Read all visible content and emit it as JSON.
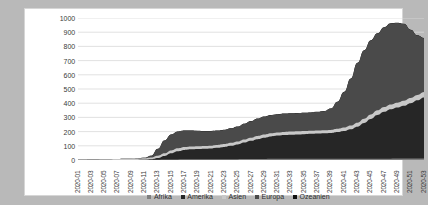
{
  "chart_data": {
    "type": "area",
    "stacked": true,
    "title": "",
    "xlabel": "",
    "ylabel": "",
    "ylim": [
      0,
      1000
    ],
    "ytick_labels": [
      "1000",
      "900",
      "800",
      "700",
      "600",
      "500",
      "400",
      "300",
      "200",
      "100",
      "0"
    ],
    "ytick_values": [
      1000,
      900,
      800,
      700,
      600,
      500,
      400,
      300,
      200,
      100,
      0
    ],
    "grid": true,
    "legend_position": "bottom",
    "x": [
      "2020-01",
      "2020-02",
      "2020-03",
      "2020-04",
      "2020-05",
      "2020-06",
      "2020-07",
      "2020-08",
      "2020-09",
      "2020-10",
      "2020-11",
      "2020-12",
      "2020-13",
      "2020-14",
      "2020-15",
      "2020-16",
      "2020-17",
      "2020-18",
      "2020-19",
      "2020-20",
      "2020-21",
      "2020-22",
      "2020-23",
      "2020-24",
      "2020-25",
      "2020-26",
      "2020-27",
      "2020-28",
      "2020-29",
      "2020-30",
      "2020-31",
      "2020-32",
      "2020-33",
      "2020-34",
      "2020-35",
      "2020-36",
      "2020-37",
      "2020-38",
      "2020-39",
      "2020-40",
      "2020-41",
      "2020-42",
      "2020-43",
      "2020-44",
      "2020-45",
      "2020-46",
      "2020-47",
      "2020-48",
      "2020-49",
      "2020-50",
      "2020-51",
      "2020-52",
      "2020-53"
    ],
    "xtick_labels": [
      "2020-01",
      "2020-03",
      "2020-05",
      "2020-07",
      "2020-09",
      "2020-11",
      "2020-13",
      "2020-15",
      "2020-17",
      "2020-19",
      "2020-21",
      "2020-23",
      "2020-25",
      "2020-27",
      "2020-29",
      "2020-31",
      "2020-33",
      "2020-35",
      "2020-37",
      "2020-39",
      "2020-41",
      "2020-43",
      "2020-45",
      "2020-47",
      "2020-49",
      "2020-51",
      "2020-53"
    ],
    "series": [
      {
        "name": "Afrika",
        "color": "#7f7f7f",
        "values": [
          0,
          0,
          0,
          0,
          0,
          0,
          0,
          0,
          0,
          0,
          0,
          1,
          2,
          3,
          4,
          4,
          5,
          5,
          5,
          5,
          5,
          6,
          6,
          6,
          6,
          7,
          7,
          7,
          7,
          8,
          8,
          8,
          8,
          8,
          8,
          8,
          8,
          8,
          8,
          9,
          9,
          9,
          9,
          9,
          9,
          9,
          9,
          9,
          10,
          10,
          10,
          10,
          10
        ]
      },
      {
        "name": "Amerika",
        "color": "#262626",
        "values": [
          0,
          0,
          0,
          0,
          0,
          0,
          0,
          0,
          0,
          0,
          1,
          4,
          12,
          26,
          44,
          58,
          66,
          70,
          72,
          74,
          76,
          80,
          86,
          94,
          104,
          116,
          128,
          140,
          150,
          158,
          164,
          168,
          170,
          172,
          174,
          176,
          178,
          180,
          182,
          188,
          196,
          208,
          226,
          252,
          280,
          308,
          330,
          348,
          360,
          372,
          390,
          410,
          430
        ]
      },
      {
        "name": "Asien",
        "color": "#c8c8c8",
        "values": [
          1,
          2,
          3,
          4,
          5,
          6,
          7,
          8,
          9,
          10,
          11,
          13,
          16,
          18,
          19,
          20,
          20,
          20,
          20,
          20,
          20,
          20,
          20,
          21,
          21,
          22,
          22,
          22,
          22,
          22,
          22,
          22,
          22,
          22,
          22,
          22,
          22,
          22,
          22,
          23,
          24,
          26,
          28,
          30,
          32,
          33,
          34,
          34,
          34,
          35,
          36,
          37,
          38
        ]
      },
      {
        "name": "Europa",
        "color": "#4a4a4a",
        "values": [
          0,
          0,
          0,
          0,
          0,
          0,
          0,
          0,
          0,
          1,
          3,
          12,
          48,
          90,
          112,
          118,
          116,
          112,
          108,
          104,
          102,
          100,
          100,
          102,
          104,
          110,
          116,
          122,
          126,
          128,
          128,
          128,
          128,
          128,
          128,
          128,
          130,
          134,
          150,
          190,
          250,
          330,
          420,
          480,
          520,
          540,
          560,
          570,
          560,
          540,
          480,
          420,
          380
        ]
      },
      {
        "name": "Ozeanien",
        "color": "#111111",
        "values": [
          0,
          0,
          0,
          0,
          0,
          0,
          0,
          0,
          0,
          0,
          0,
          0,
          1,
          1,
          1,
          1,
          1,
          1,
          1,
          1,
          1,
          1,
          1,
          1,
          1,
          1,
          1,
          1,
          1,
          1,
          1,
          1,
          1,
          1,
          1,
          1,
          1,
          1,
          1,
          1,
          1,
          1,
          1,
          2,
          2,
          2,
          2,
          2,
          2,
          2,
          2,
          2,
          2
        ]
      }
    ]
  },
  "legend": {
    "items": [
      {
        "label": "Afrika",
        "color": "#7f7f7f"
      },
      {
        "label": "Amerika",
        "color": "#262626"
      },
      {
        "label": "Asien",
        "color": "#c8c8c8"
      },
      {
        "label": "Europa",
        "color": "#4a4a4a"
      },
      {
        "label": "Ozeanien",
        "color": "#111111"
      }
    ]
  },
  "style": {
    "page_background": "#b9b9b9",
    "chart_background": "#ffffff",
    "gridline_color": "#d9d9d9",
    "axis_text_color": "#3a3a3a"
  }
}
